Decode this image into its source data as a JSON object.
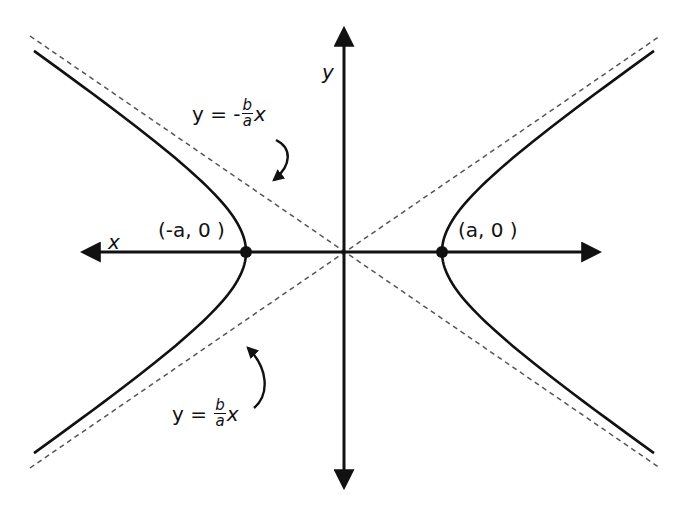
{
  "diagram": {
    "type": "hyperbola",
    "center": {
      "x": 344,
      "y": 252
    },
    "a": 98,
    "b": 67,
    "colors": {
      "curve": "#111111",
      "axis": "#111111",
      "asymptote": "#555555",
      "background": "#ffffff"
    },
    "axes": {
      "x_label": "x",
      "y_label": "y"
    },
    "vertices": [
      {
        "label": "(-a, 0 )",
        "x": 246,
        "y": 252
      },
      {
        "label": "(a, 0 )",
        "x": 442,
        "y": 252
      }
    ],
    "asymptotes": [
      {
        "prefix": "y = -",
        "num": "b",
        "den": "a",
        "suffix": "x"
      },
      {
        "prefix": "y =",
        "num": "b",
        "den": "a",
        "suffix": "x"
      }
    ]
  }
}
